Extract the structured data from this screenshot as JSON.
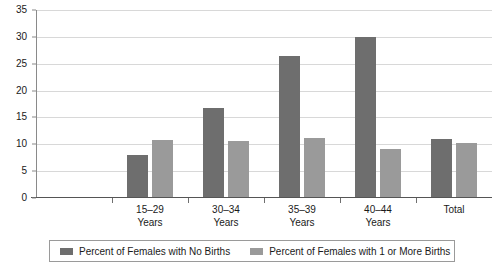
{
  "chart_data": {
    "type": "bar",
    "title": "",
    "subtitle": "",
    "xlabel": "",
    "ylabel": "",
    "ylim": [
      0,
      35
    ],
    "ytick_values": [
      0,
      5,
      10,
      15,
      20,
      25,
      30,
      35
    ],
    "ytick_labels": [
      "0",
      "5",
      "10",
      "15",
      "20",
      "25",
      "30",
      "35"
    ],
    "grid": true,
    "legend_position": "bottom",
    "categories": [
      "15–29\nYears",
      "30–34\nYears",
      "35–39\nYears",
      "40–44\nYears",
      "Total"
    ],
    "category_labels": [
      {
        "line1": "15–29",
        "line2": "Years"
      },
      {
        "line1": "30–34",
        "line2": "Years"
      },
      {
        "line1": "35–39",
        "line2": "Years"
      },
      {
        "line1": "40–44",
        "line2": "Years"
      },
      {
        "line1": "Total",
        "line2": ""
      }
    ],
    "series": [
      {
        "name": "Percent of Females with No Births",
        "color": "#6e6e6e",
        "values": [
          8.0,
          16.8,
          26.4,
          30.0,
          10.9
        ]
      },
      {
        "name": "Percent of Females with 1 or More Births",
        "color": "#9a9a9a",
        "values": [
          10.8,
          10.6,
          11.1,
          9.1,
          10.3
        ]
      }
    ]
  },
  "legend": {
    "entries": [
      {
        "label": "Percent of Females with No Births",
        "color": "#6e6e6e"
      },
      {
        "label": "Percent of Females with 1 or More Births",
        "color": "#9a9a9a"
      }
    ]
  },
  "colors": {
    "series_dark": "#6e6e6e",
    "series_light": "#9a9a9a",
    "gridline": "#d8d8d8",
    "axis": "#555555",
    "background": "#ffffff",
    "text": "#1a1a1a"
  }
}
